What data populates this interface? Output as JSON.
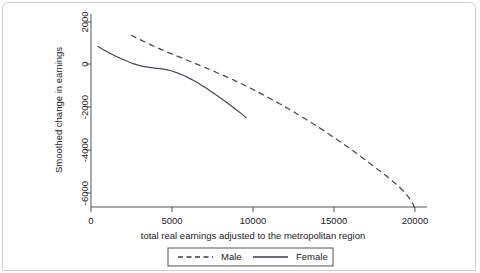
{
  "figure": {
    "background_color": "#ffffff",
    "frame_color": "#cfcfcf",
    "line_color": "#4a4a55"
  },
  "chart_data": {
    "type": "line",
    "title": "",
    "xlabel": "total real earnings adjusted to the metropolitan region",
    "ylabel": "Smoothed change in earnings",
    "xlim": [
      -400,
      21600
    ],
    "ylim": [
      -7400,
      2600
    ],
    "xticks": [
      0,
      5000,
      10000,
      15000,
      20000
    ],
    "xticklabels": [
      "0",
      "5000",
      "10000",
      "15000",
      "20000"
    ],
    "yticks": [
      2000,
      0,
      -2000,
      -4000,
      -6000
    ],
    "yticklabels": [
      "2000",
      "0",
      "-2000",
      "-4000",
      "-6000"
    ],
    "grid": false,
    "legend_position": "below-axes",
    "series": [
      {
        "name": "Male",
        "style": "dashed",
        "color": "#4a4a55",
        "points": [
          [
            2470,
            1380
          ],
          [
            3090,
            1150
          ],
          [
            3700,
            930
          ],
          [
            4320,
            720
          ],
          [
            4940,
            520
          ],
          [
            5560,
            330
          ],
          [
            6170,
            140
          ],
          [
            6790,
            -50
          ],
          [
            7410,
            -250
          ],
          [
            8020,
            -450
          ],
          [
            8640,
            -660
          ],
          [
            9260,
            -880
          ],
          [
            9880,
            -1110
          ],
          [
            10490,
            -1350
          ],
          [
            11110,
            -1600
          ],
          [
            11730,
            -1860
          ],
          [
            12340,
            -2130
          ],
          [
            12960,
            -2410
          ],
          [
            13580,
            -2700
          ],
          [
            14200,
            -3000
          ],
          [
            14810,
            -3310
          ],
          [
            15430,
            -3630
          ],
          [
            16050,
            -3960
          ],
          [
            16670,
            -4300
          ],
          [
            17280,
            -4650
          ],
          [
            17900,
            -5010
          ],
          [
            18520,
            -5390
          ],
          [
            19130,
            -5790
          ],
          [
            19750,
            -6350
          ],
          [
            20000,
            -6750
          ]
        ]
      },
      {
        "name": "Female",
        "style": "solid",
        "color": "#4a4a55",
        "points": [
          [
            430,
            850
          ],
          [
            800,
            690
          ],
          [
            1170,
            540
          ],
          [
            1540,
            400
          ],
          [
            1910,
            270
          ],
          [
            2280,
            150
          ],
          [
            2650,
            40
          ],
          [
            3020,
            -40
          ],
          [
            3400,
            -100
          ],
          [
            3770,
            -140
          ],
          [
            4140,
            -170
          ],
          [
            4510,
            -210
          ],
          [
            4880,
            -270
          ],
          [
            5250,
            -360
          ],
          [
            5620,
            -470
          ],
          [
            5990,
            -600
          ],
          [
            6360,
            -750
          ],
          [
            6730,
            -910
          ],
          [
            7100,
            -1090
          ],
          [
            7470,
            -1280
          ],
          [
            7840,
            -1470
          ],
          [
            8210,
            -1670
          ],
          [
            8580,
            -1880
          ],
          [
            8950,
            -2090
          ],
          [
            9320,
            -2310
          ],
          [
            9570,
            -2470
          ]
        ]
      }
    ]
  },
  "legend": {
    "entries": [
      {
        "label": "Male",
        "style": "dashed"
      },
      {
        "label": "Female",
        "style": "solid"
      }
    ]
  },
  "footer": {
    "bleed_text": ""
  }
}
